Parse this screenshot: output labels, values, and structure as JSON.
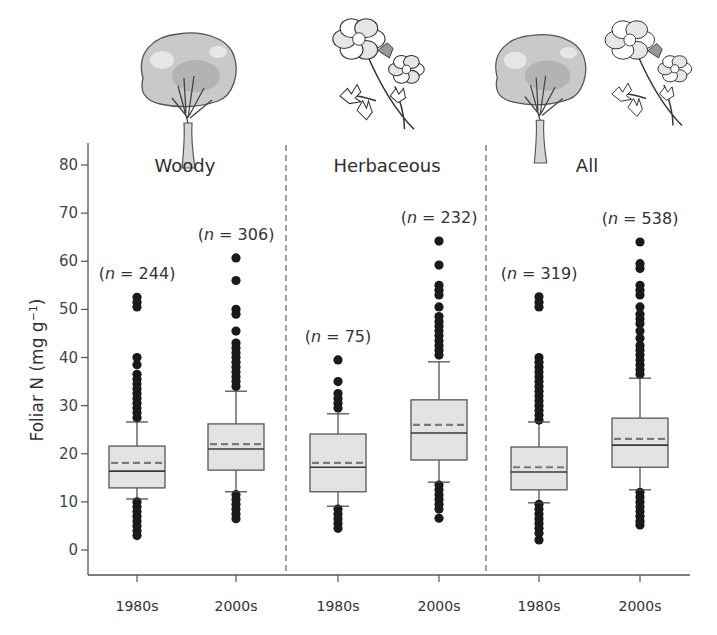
{
  "chart_data": {
    "type": "box",
    "title": "",
    "xlabel": "",
    "ylabel": "Foliar N (mg g⁻¹)",
    "ylabel_base": "Foliar N (mg g",
    "ylabel_sup": "−1",
    "ylabel_close": ")",
    "ylim": [
      -5,
      85
    ],
    "yticks": [
      0,
      10,
      20,
      30,
      40,
      50,
      60,
      70,
      80
    ],
    "grid": false,
    "legend": "none",
    "groups": [
      {
        "name": "Woody",
        "icon": "tree-icon"
      },
      {
        "name": "Herbaceous",
        "icon": "flower-icon"
      },
      {
        "name": "All",
        "icon": "tree-and-flower-icon"
      }
    ],
    "categories": [
      "1980s",
      "2000s",
      "1980s",
      "2000s",
      "1980s",
      "2000s"
    ],
    "series": [
      {
        "group": "Woody",
        "period": "1980s",
        "n": 244,
        "n_label": "(n = 244)",
        "whisker_low": 10.6,
        "q1": 12.9,
        "median": 16.4,
        "mean": 18.1,
        "q3": 21.6,
        "whisker_high": 26.6,
        "outliers": [
          52.5,
          51.5,
          50.5,
          40.0,
          38.5,
          36.5,
          35.5,
          34.5,
          33.5,
          32.5,
          31.5,
          30.5,
          29.5,
          28.5,
          27.5,
          10.0,
          9.0,
          8.0,
          7.0,
          6.0,
          5.0,
          4.0,
          3.0
        ]
      },
      {
        "group": "Woody",
        "period": "2000s",
        "n": 306,
        "n_label": "(n = 306)",
        "whisker_low": 12.1,
        "q1": 16.6,
        "median": 21.0,
        "mean": 22.0,
        "q3": 26.2,
        "whisker_high": 33.0,
        "outliers": [
          60.7,
          56.0,
          50.0,
          49.0,
          45.5,
          43.0,
          42.0,
          41.0,
          40.0,
          39.0,
          38.0,
          37.0,
          36.0,
          35.0,
          34.0,
          11.5,
          10.5,
          9.5,
          8.5,
          7.5,
          6.5
        ]
      },
      {
        "group": "Herbaceous",
        "period": "1980s",
        "n": 75,
        "n_label": "(n = 75)",
        "whisker_low": 9.1,
        "q1": 12.1,
        "median": 17.2,
        "mean": 18.1,
        "q3": 24.1,
        "whisker_high": 28.3,
        "outliers": [
          39.5,
          35.0,
          32.5,
          31.5,
          30.5,
          29.5,
          8.5,
          7.5,
          6.5,
          5.5,
          4.5
        ]
      },
      {
        "group": "Herbaceous",
        "period": "2000s",
        "n": 232,
        "n_label": "(n = 232)",
        "whisker_low": 14.1,
        "q1": 18.7,
        "median": 24.3,
        "mean": 26.0,
        "q3": 31.2,
        "whisker_high": 39.1,
        "outliers": [
          64.2,
          59.2,
          55.0,
          54.0,
          53.0,
          50.5,
          48.5,
          47.5,
          46.5,
          45.5,
          44.5,
          43.5,
          42.5,
          41.5,
          40.5,
          13.5,
          12.5,
          11.5,
          10.5,
          9.5,
          8.5,
          6.6
        ]
      },
      {
        "group": "All",
        "period": "1980s",
        "n": 319,
        "n_label": "(n = 319)",
        "whisker_low": 9.8,
        "q1": 12.5,
        "median": 16.2,
        "mean": 17.2,
        "q3": 21.4,
        "whisker_high": 26.6,
        "outliers": [
          52.6,
          51.5,
          50.5,
          40.0,
          39.0,
          38.0,
          37.0,
          36.0,
          35.0,
          34.0,
          33.0,
          32.0,
          31.0,
          30.0,
          29.0,
          28.0,
          27.0,
          9.5,
          8.5,
          7.5,
          6.5,
          5.5,
          4.5,
          3.5,
          2.1
        ]
      },
      {
        "group": "All",
        "period": "2000s",
        "n": 538,
        "n_label": "(n = 538)",
        "whisker_low": 12.5,
        "q1": 17.2,
        "median": 21.8,
        "mean": 23.1,
        "q3": 27.4,
        "whisker_high": 35.7,
        "outliers": [
          64.0,
          59.5,
          58.5,
          55.0,
          54.0,
          53.0,
          50.5,
          49.0,
          48.0,
          47.0,
          45.5,
          44.0,
          42.5,
          41.5,
          40.5,
          39.5,
          38.5,
          37.5,
          36.5,
          12.0,
          11.0,
          10.0,
          9.0,
          8.0,
          7.0,
          6.0,
          5.2
        ]
      }
    ],
    "annotations": [
      "mean shown as dashed line",
      "median shown as solid line"
    ]
  },
  "colors": {
    "box_fill": "#e3e3e3",
    "box_edge": "#555555",
    "median": "#3a3a3a",
    "mean": "#7a7a7a",
    "outlier": "#1a1a1a",
    "axis": "#555555",
    "divider": "#555555"
  }
}
